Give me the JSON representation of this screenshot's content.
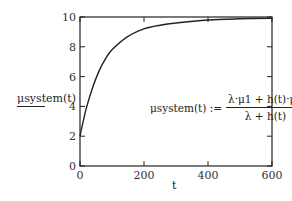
{
  "chart_data": {
    "type": "line",
    "title": "",
    "xlabel": "t",
    "ylabel": "μsystem(t)",
    "xlim": [
      0,
      600
    ],
    "ylim": [
      0,
      10
    ],
    "x_ticks": [
      "0",
      "200",
      "400",
      "600"
    ],
    "y_ticks": [
      "0",
      "2",
      "4",
      "6",
      "8",
      "10"
    ],
    "grid": false,
    "series": [
      {
        "name": "μsystem(t)",
        "x": [
          0,
          10,
          20,
          40,
          60,
          80,
          100,
          150,
          200,
          250,
          300,
          400,
          500,
          600
        ],
        "values": [
          2.0,
          3.0,
          3.9,
          5.3,
          6.4,
          7.2,
          7.8,
          8.7,
          9.2,
          9.45,
          9.6,
          9.8,
          9.88,
          9.92
        ]
      }
    ],
    "annotation": {
      "lhs": "μsystem(t) :=",
      "numerator": "λ·μ1 + h(t)·μ2",
      "denominator": "λ + h(t)"
    }
  },
  "labels": {
    "ylabel": "μsystem(t)",
    "xlabel": "t",
    "formula_lhs": "μsystem(t) :=",
    "formula_num": "λ·μ1 + h(t)·μ2",
    "formula_den": "λ + h(t)"
  }
}
